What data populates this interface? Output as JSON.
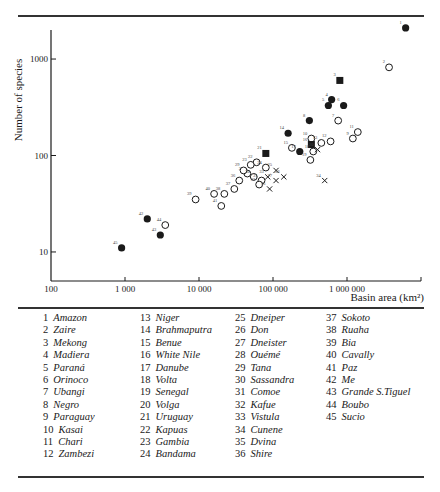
{
  "chart_data": {
    "type": "scatter",
    "title": "",
    "xlabel": "Basin area (km²)",
    "ylabel": "Number of species",
    "xscale": "log",
    "yscale": "log",
    "xlim": [
      100,
      10000000
    ],
    "ylim": [
      5,
      2000
    ],
    "x_ticks": [
      100,
      1000,
      10000,
      100000,
      1000000
    ],
    "x_tick_labels": [
      "100",
      "1 000",
      "10 000",
      "100 000",
      "1 000 000"
    ],
    "y_ticks": [
      10,
      100,
      1000
    ],
    "y_tick_labels": [
      "10",
      "100",
      "1000"
    ],
    "grid": false,
    "marker_legend": {
      "filled_circle": "filled circle",
      "open_circle": "open circle",
      "filled_square": "filled square",
      "cross": "cross"
    },
    "points": [
      {
        "id": "1",
        "x": 6200000,
        "y": 2100,
        "marker": "filled_circle"
      },
      {
        "id": "2",
        "x": 3700000,
        "y": 820,
        "marker": "open_circle"
      },
      {
        "id": "3",
        "x": 800000,
        "y": 600,
        "marker": "filled_square"
      },
      {
        "id": "4",
        "x": 620000,
        "y": 380,
        "marker": "filled_circle"
      },
      {
        "id": "5",
        "x": 560000,
        "y": 330,
        "marker": "filled_circle"
      },
      {
        "id": "6",
        "x": 900000,
        "y": 330,
        "marker": "filled_circle"
      },
      {
        "id": "7",
        "x": 760000,
        "y": 230,
        "marker": "open_circle"
      },
      {
        "id": "8",
        "x": 310000,
        "y": 230,
        "marker": "filled_circle"
      },
      {
        "id": "9",
        "x": 1200000,
        "y": 150,
        "marker": "open_circle"
      },
      {
        "id": "10",
        "x": 330000,
        "y": 150,
        "marker": "open_circle"
      },
      {
        "id": "11",
        "x": 1400000,
        "y": 175,
        "marker": "open_circle"
      },
      {
        "id": "12",
        "x": 600000,
        "y": 140,
        "marker": "open_circle"
      },
      {
        "id": "13",
        "x": 450000,
        "y": 135,
        "marker": "open_circle"
      },
      {
        "id": "14",
        "x": 160000,
        "y": 170,
        "marker": "filled_circle"
      },
      {
        "id": "15",
        "x": 180000,
        "y": 120,
        "marker": "open_circle"
      },
      {
        "id": "16",
        "x": 330000,
        "y": 130,
        "marker": "filled_square"
      },
      {
        "id": "17",
        "x": 230000,
        "y": 110,
        "marker": "filled_circle"
      },
      {
        "id": "18",
        "x": 350000,
        "y": 110,
        "marker": "open_circle"
      },
      {
        "id": "19",
        "x": 320000,
        "y": 90,
        "marker": "open_circle"
      },
      {
        "id": "20",
        "x": 400000,
        "y": 115,
        "marker": "cross"
      },
      {
        "id": "21",
        "x": 80000,
        "y": 105,
        "marker": "filled_square"
      },
      {
        "id": "22",
        "x": 60000,
        "y": 85,
        "marker": "open_circle"
      },
      {
        "id": "23",
        "x": 50000,
        "y": 80,
        "marker": "open_circle"
      },
      {
        "id": "24",
        "x": 80000,
        "y": 75,
        "marker": "open_circle"
      },
      {
        "id": "25",
        "x": 110000,
        "y": 70,
        "marker": "cross"
      },
      {
        "id": "26",
        "x": 140000,
        "y": 60,
        "marker": "cross"
      },
      {
        "id": "27",
        "x": 110000,
        "y": 55,
        "marker": "cross"
      },
      {
        "id": "28",
        "x": 45000,
        "y": 65,
        "marker": "open_circle"
      },
      {
        "id": "29",
        "x": 40000,
        "y": 70,
        "marker": "open_circle"
      },
      {
        "id": "30",
        "x": 55000,
        "y": 60,
        "marker": "open_circle"
      },
      {
        "id": "31",
        "x": 70000,
        "y": 55,
        "marker": "open_circle"
      },
      {
        "id": "32",
        "x": 65000,
        "y": 50,
        "marker": "open_circle"
      },
      {
        "id": "33",
        "x": 85000,
        "y": 60,
        "marker": "cross"
      },
      {
        "id": "34",
        "x": 500000,
        "y": 55,
        "marker": "cross"
      },
      {
        "id": "35",
        "x": 90000,
        "y": 45,
        "marker": "cross"
      },
      {
        "id": "36",
        "x": 35000,
        "y": 55,
        "marker": "open_circle"
      },
      {
        "id": "37",
        "x": 30000,
        "y": 45,
        "marker": "open_circle"
      },
      {
        "id": "38",
        "x": 22000,
        "y": 40,
        "marker": "open_circle"
      },
      {
        "id": "39",
        "x": 9000,
        "y": 35,
        "marker": "open_circle"
      },
      {
        "id": "40",
        "x": 16000,
        "y": 40,
        "marker": "open_circle"
      },
      {
        "id": "41",
        "x": 20000,
        "y": 30,
        "marker": "open_circle"
      },
      {
        "id": "42",
        "x": 2000,
        "y": 22,
        "marker": "filled_circle"
      },
      {
        "id": "43",
        "x": 3000,
        "y": 15,
        "marker": "filled_circle"
      },
      {
        "id": "44",
        "x": 3500,
        "y": 19,
        "marker": "open_circle"
      },
      {
        "id": "45",
        "x": 900,
        "y": 11,
        "marker": "filled_circle"
      }
    ]
  },
  "legend": {
    "columns": [
      [
        {
          "num": "1",
          "name": "Amazon"
        },
        {
          "num": "2",
          "name": "Zaire"
        },
        {
          "num": "3",
          "name": "Mekong"
        },
        {
          "num": "4",
          "name": "Madiera"
        },
        {
          "num": "5",
          "name": "Paraná"
        },
        {
          "num": "6",
          "name": "Orinoco"
        },
        {
          "num": "7",
          "name": "Ubangi"
        },
        {
          "num": "8",
          "name": "Negro"
        },
        {
          "num": "9",
          "name": "Paraguay"
        },
        {
          "num": "10",
          "name": "Kasai"
        },
        {
          "num": "11",
          "name": "Chari"
        },
        {
          "num": "12",
          "name": "Zambezi"
        }
      ],
      [
        {
          "num": "13",
          "name": "Niger"
        },
        {
          "num": "14",
          "name": "Brahmaputra"
        },
        {
          "num": "15",
          "name": "Benue"
        },
        {
          "num": "16",
          "name": "White Nile"
        },
        {
          "num": "17",
          "name": "Danube"
        },
        {
          "num": "18",
          "name": "Volta"
        },
        {
          "num": "19",
          "name": "Senegal"
        },
        {
          "num": "20",
          "name": "Volga"
        },
        {
          "num": "21",
          "name": "Uruguay"
        },
        {
          "num": "22",
          "name": "Kapuas"
        },
        {
          "num": "23",
          "name": "Gambia"
        },
        {
          "num": "24",
          "name": "Bandama"
        }
      ],
      [
        {
          "num": "25",
          "name": "Dneiper"
        },
        {
          "num": "26",
          "name": "Don"
        },
        {
          "num": "27",
          "name": "Dneister"
        },
        {
          "num": "28",
          "name": "Ouémé"
        },
        {
          "num": "29",
          "name": "Tana"
        },
        {
          "num": "30",
          "name": "Sassandra"
        },
        {
          "num": "31",
          "name": "Comoe"
        },
        {
          "num": "32",
          "name": "Kafue"
        },
        {
          "num": "33",
          "name": "Vistula"
        },
        {
          "num": "34",
          "name": "Cunene"
        },
        {
          "num": "35",
          "name": "Dvina"
        },
        {
          "num": "36",
          "name": "Shire"
        }
      ],
      [
        {
          "num": "37",
          "name": "Sokoto"
        },
        {
          "num": "38",
          "name": "Ruaha"
        },
        {
          "num": "39",
          "name": "Bia"
        },
        {
          "num": "40",
          "name": "Cavally"
        },
        {
          "num": "41",
          "name": "Paz"
        },
        {
          "num": "42",
          "name": "Me"
        },
        {
          "num": "43",
          "name": "Grande S.Tiguel"
        },
        {
          "num": "44",
          "name": "Boubo"
        },
        {
          "num": "45",
          "name": "Sucio"
        }
      ]
    ]
  },
  "colors": {
    "ink": "#1a1a1a",
    "background": "#ffffff"
  }
}
